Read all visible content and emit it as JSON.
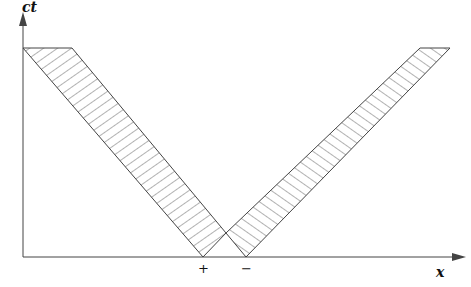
{
  "diagram": {
    "axes": {
      "y_label": "ct",
      "x_label": "x"
    },
    "ticks": [
      {
        "label": "+",
        "x": 203
      },
      {
        "label": "−",
        "x": 246
      }
    ],
    "bands": [
      {
        "name": "left-moving-band",
        "points": "23,48 72,48 226,233 203,257"
      },
      {
        "name": "right-moving-band",
        "points": "226,233 420,48 450,48 246,257"
      }
    ],
    "colors": {
      "line": "#444444",
      "hatch": "#555555"
    }
  }
}
